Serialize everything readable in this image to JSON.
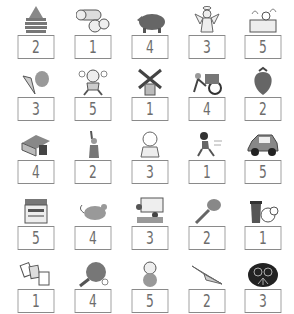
{
  "rows": [
    {
      "items": [
        {
          "picture": "stacked-pancake-icon",
          "number": "2"
        },
        {
          "picture": "logs-icon",
          "number": "1"
        },
        {
          "picture": "boar-icon",
          "number": "4"
        },
        {
          "picture": "angel-icon",
          "number": "3"
        },
        {
          "picture": "bath-icon",
          "number": "5"
        }
      ]
    },
    {
      "items": [
        {
          "picture": "shells-icon",
          "number": "3"
        },
        {
          "picture": "crying-child-icon",
          "number": "5"
        },
        {
          "picture": "windmill-icon",
          "number": "1"
        },
        {
          "picture": "rickshaw-icon",
          "number": "4"
        },
        {
          "picture": "strawberry-icon",
          "number": "2"
        }
      ]
    },
    {
      "items": [
        {
          "picture": "kotatsu-icon",
          "number": "4"
        },
        {
          "picture": "statue-of-liberty-icon",
          "number": "2"
        },
        {
          "picture": "baby-icon",
          "number": "3"
        },
        {
          "picture": "running-boy-icon",
          "number": "1"
        },
        {
          "picture": "car-icon",
          "number": "5"
        }
      ]
    },
    {
      "items": [
        {
          "picture": "copier-icon",
          "number": "5"
        },
        {
          "picture": "mouse-icon",
          "number": "4"
        },
        {
          "picture": "classroom-icon",
          "number": "3"
        },
        {
          "picture": "key-icon",
          "number": "2"
        },
        {
          "picture": "trash-can-icon",
          "number": "1"
        }
      ]
    },
    {
      "items": [
        {
          "picture": "playing-cards-icon",
          "number": "1"
        },
        {
          "picture": "ping-pong-paddle-icon",
          "number": "4"
        },
        {
          "picture": "owl-icon",
          "number": "5"
        },
        {
          "picture": "paper-airplane-icon",
          "number": "2"
        },
        {
          "picture": "fireworks-icon",
          "number": "3"
        }
      ]
    }
  ],
  "colors": {
    "box_border": "#8a8a8a",
    "number": "#6d6d6d",
    "icon": "#7a7a7a"
  }
}
